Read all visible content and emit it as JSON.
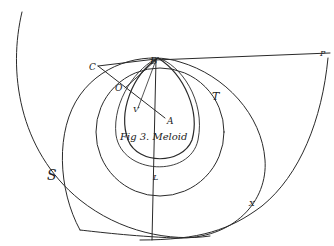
{
  "figure": {
    "caption": "Fig 3. Meloid",
    "labels": {
      "B": "B",
      "P": "P",
      "C": "C",
      "O": "O",
      "V": "V",
      "A": "A",
      "T": "T",
      "S": "S",
      "L": "L",
      "X": "X"
    },
    "ink_color": "#2a2a2a",
    "background": "#ffffff"
  }
}
